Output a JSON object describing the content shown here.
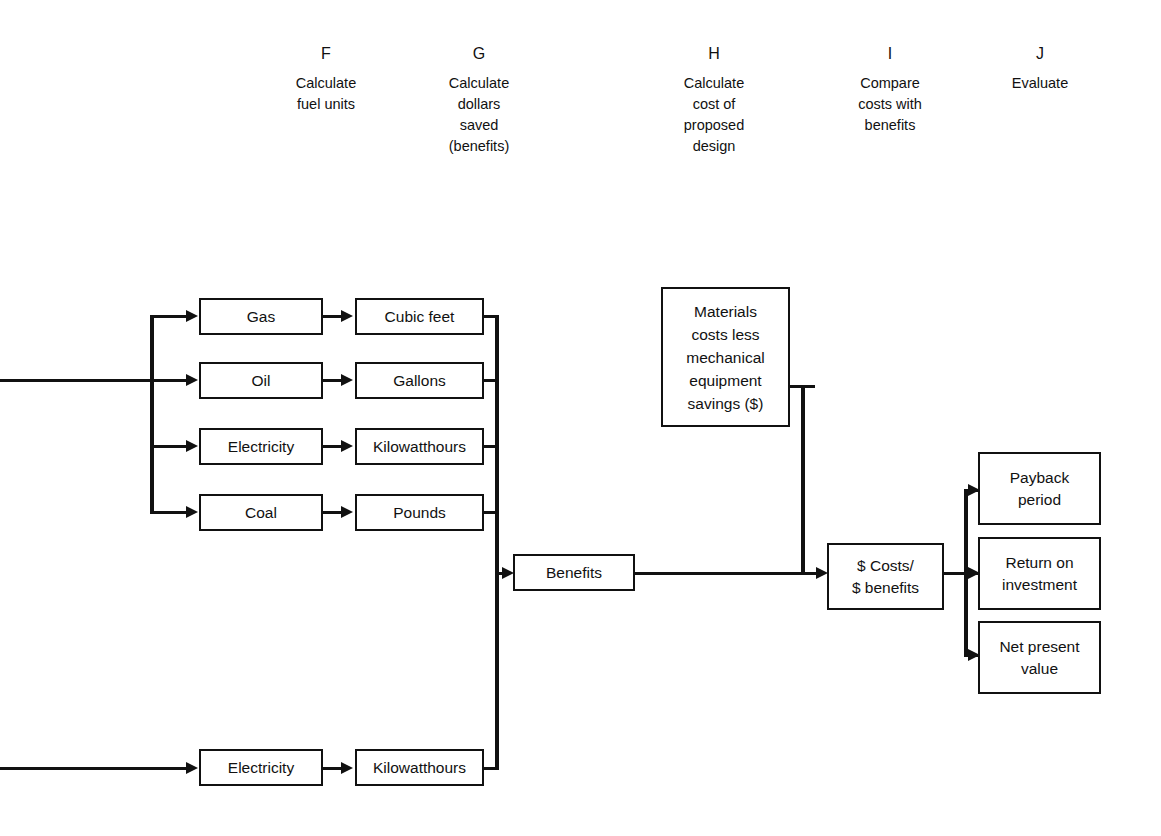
{
  "diagram": {
    "line_color": "#111111",
    "box_fill": "#ffffff",
    "columns": [
      {
        "letter": "F",
        "description": "Calculate\nfuel units"
      },
      {
        "letter": "G",
        "description": "Calculate\ndollars\nsaved\n(benefits)"
      },
      {
        "letter": "H",
        "description": "Calculate\ncost of\nproposed\ndesign"
      },
      {
        "letter": "I",
        "description": "Compare\ncosts with\nbenefits"
      },
      {
        "letter": "J",
        "description": "Evaluate"
      }
    ],
    "nodes": {
      "fuel_gas": "Gas",
      "fuel_oil": "Oil",
      "fuel_electricity": "Electricity",
      "fuel_coal": "Coal",
      "unit_cubic_feet": "Cubic feet",
      "unit_gallons": "Gallons",
      "unit_kilowatthours": "Kilowatthours",
      "unit_pounds": "Pounds",
      "materials_costs": "Materials\ncosts less\nmechanical\nequipment\nsavings ($)",
      "benefits": "Benefits",
      "costs_benefits": "$ Costs/\n$ benefits",
      "payback_period": "Payback\nperiod",
      "return_on_investment": "Return on\ninvestment",
      "net_present_value": "Net present\nvalue",
      "bottom_electricity": "Electricity",
      "bottom_kilowatthours": "Kilowatthours"
    }
  }
}
